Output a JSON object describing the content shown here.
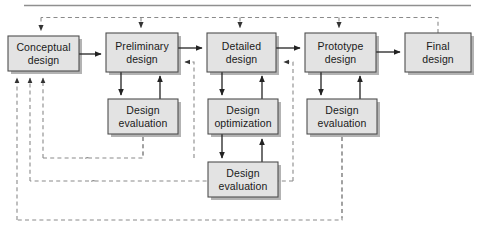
{
  "figure": {
    "top_rule": true,
    "colors": {
      "box_fill": "#e2e2e2",
      "box_stroke": "#4d4d4d",
      "box_shadow": "#b0b0b0",
      "solid_line": "#222222",
      "dashed_line": "#8c8c8c",
      "rule": "#888888",
      "text": "#1a1a1a",
      "background": "#ffffff"
    }
  },
  "nodes": {
    "conceptual_design": {
      "label": "Conceptual\ndesign",
      "line1": "Conceptual",
      "line2": "design",
      "x": 8,
      "y": 36,
      "w": 71,
      "h": 35
    },
    "preliminary_design": {
      "label": "Preliminary\ndesign",
      "line1": "Preliminary",
      "line2": "design",
      "x": 106,
      "y": 33,
      "w": 72,
      "h": 39
    },
    "detailed_design": {
      "label": "Detailed\ndesign",
      "line1": "Detailed",
      "line2": "design",
      "x": 207,
      "y": 33,
      "w": 69,
      "h": 39
    },
    "prototype_design": {
      "label": "Prototype\ndesign",
      "line1": "Prototype",
      "line2": "design",
      "x": 305,
      "y": 33,
      "w": 71,
      "h": 39
    },
    "final_design": {
      "label": "Final\ndesign",
      "line1": "Final",
      "line2": "design",
      "x": 405,
      "y": 33,
      "w": 66,
      "h": 39
    },
    "design_evaluation_preliminary": {
      "label": "Design\nevaluation",
      "line1": "Design",
      "line2": "evaluation",
      "x": 108,
      "y": 99,
      "w": 70,
      "h": 35
    },
    "design_optimization_detailed": {
      "label": "Design\noptimization",
      "line1": "Design",
      "line2": "optimization",
      "x": 208,
      "y": 99,
      "w": 70,
      "h": 35
    },
    "design_evaluation_prototype": {
      "label": "Design\nevaluation",
      "line1": "Design",
      "line2": "evaluation",
      "x": 307,
      "y": 99,
      "w": 70,
      "h": 35
    },
    "design_evaluation_detailed": {
      "label": "Design\nevaluation",
      "line1": "Design",
      "line2": "evaluation",
      "x": 208,
      "y": 162,
      "w": 70,
      "h": 35
    }
  },
  "flow": {
    "forward_sequence": [
      "Conceptual design",
      "Preliminary design",
      "Detailed design",
      "Prototype design",
      "Final design"
    ],
    "solid_edges": [
      "Conceptual design -> Preliminary design",
      "Preliminary design -> Detailed design",
      "Detailed design -> Prototype design",
      "Prototype design -> Final design",
      "Preliminary design -> Design evaluation",
      "Design evaluation -> Preliminary design",
      "Detailed design -> Design optimization",
      "Design optimization -> Detailed design",
      "Design optimization -> Design evaluation",
      "Design evaluation -> Design optimization",
      "Prototype design -> Design evaluation",
      "Design evaluation -> Prototype design"
    ],
    "dashed_feedback_edges": [
      "Final design -> Conceptual design (top bus)",
      "Final design -> Preliminary design (top bus)",
      "Final design -> Detailed design (top bus)",
      "Final design -> Prototype design (top bus)",
      "Design evaluation (preliminary) -> Conceptual design (bottom return)",
      "Design evaluation (detailed) -> Conceptual design (bottom return)",
      "Design evaluation (prototype) -> Conceptual design (bottom return)",
      "Design evaluation (preliminary) -> Preliminary design (side return)",
      "Design evaluation (detailed) -> Detailed design (side return)",
      "Design evaluation (prototype) -> Prototype design (side return)"
    ]
  }
}
